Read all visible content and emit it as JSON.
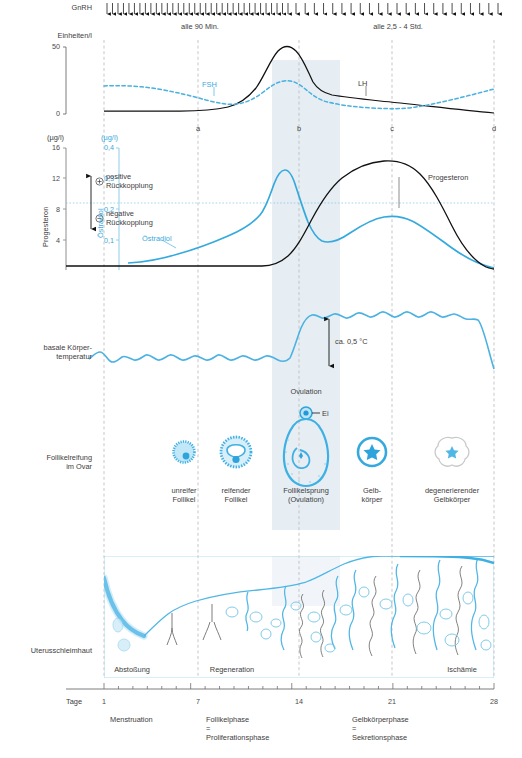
{
  "figure": {
    "accent_blue": "#3aa9dc",
    "dark": "#1a1a1a",
    "band_fill": "#dfe9ef"
  },
  "gnrh": {
    "label": "GnRH",
    "pulse_left_label": "alle 90 Min.",
    "pulse_right_label": "alle 2,5 - 4 Std.",
    "left_pulse_count": 34,
    "right_pulse_count": 23
  },
  "gonadotropin_chart": {
    "y_axis_label": "Einheiten/l",
    "y_ticks": [
      "50",
      "0"
    ],
    "series_labels": {
      "fsh": "FSH",
      "lh": "LH"
    }
  },
  "steroid_chart": {
    "y_label_left_unit": "(µg/l)",
    "y_label_right_unit": "(µg/l)",
    "y_axis_label_left": "Progesteron",
    "y_axis_label_right": "Östradiol",
    "y_ticks_left": [
      "16",
      "12",
      "8",
      "4"
    ],
    "y_ticks_right": [
      "0,4",
      "0,3",
      "0,2",
      "0,1"
    ],
    "feedback": {
      "positive_symbol": "+",
      "positive_label": "positive\nRückkopplung",
      "negative_symbol": "−",
      "negative_label": "negative\nRückkopplung"
    },
    "series_labels": {
      "estradiol": "Östradiol",
      "progesterone": "Progesteron"
    }
  },
  "temperature": {
    "label": "basale Körper-\ntemperatur",
    "delta_label": "ca. 0,5 °C",
    "ovulation_label": "Ovulation"
  },
  "ovary": {
    "label": "Follikelreifung\nim Ovar",
    "egg_label": "Ei",
    "stages": [
      {
        "name": "unreifer\nFollikel",
        "x": 184
      },
      {
        "name": "reifender\nFollikel",
        "x": 236
      },
      {
        "name": "Follikelsprung\n(Ovulation)",
        "x": 306
      },
      {
        "name": "Gelb-\nkörper",
        "x": 372
      },
      {
        "name": "degenerierender\nGelbkörper",
        "x": 452
      }
    ]
  },
  "endometrium": {
    "label": "Uterusschleimhaut",
    "annotations": [
      {
        "text": "Abstoßung",
        "x": 110
      },
      {
        "text": "Regeneration",
        "x": 206
      },
      {
        "text": "Ischämie",
        "x": 452
      }
    ]
  },
  "time_axis": {
    "label": "Tage",
    "ticks": [
      "1",
      "7",
      "14",
      "21",
      "28"
    ],
    "phases": [
      {
        "text": "Menstruation",
        "x": 110
      },
      {
        "text": "Follikelphase\n=\nProliferationsphase",
        "x": 206
      },
      {
        "text": "Gelbkörperphase\n=\nSekretionsphase",
        "x": 352
      }
    ]
  },
  "markers": {
    "letters": [
      "a",
      "b",
      "c",
      "d"
    ],
    "letter_x": [
      198,
      299,
      392,
      494
    ]
  },
  "chart_data": {
    "type": "line",
    "xlabel": "Tage",
    "x": [
      1,
      7,
      14,
      21,
      28
    ],
    "panels": [
      {
        "name": "gonadotropins",
        "ylabel": "Einheiten/l",
        "ylim": [
          0,
          55
        ],
        "yticks": [
          0,
          50
        ],
        "series": [
          {
            "name": "LH",
            "style": "solid-black",
            "x": [
              1,
              3,
              5,
              7,
              9,
              10,
              11,
              12,
              13,
              14,
              15,
              16,
              17,
              19,
              21,
              24,
              28
            ],
            "values": [
              2,
              2,
              2,
              2,
              2.5,
              4,
              9,
              25,
              42,
              46,
              38,
              28,
              24,
              21,
              18,
              12,
              1
            ]
          },
          {
            "name": "FSH",
            "style": "dashed-blue",
            "x": [
              1,
              3,
              5,
              7,
              9,
              10,
              11,
              12,
              13,
              14,
              15,
              16,
              17,
              19,
              21,
              24,
              26,
              28
            ],
            "values": [
              20,
              21,
              19,
              16,
              12,
              10,
              11,
              14,
              20,
              23,
              22,
              18,
              14,
              11,
              8,
              6,
              9,
              15
            ]
          }
        ]
      },
      {
        "name": "steroids",
        "ylabel_left": "Progesteron (µg/l)",
        "ylabel_right": "Östradiol (µg/l)",
        "ylim_left": [
          0,
          17
        ],
        "yticks_left": [
          4,
          8,
          12,
          16
        ],
        "ylim_right": [
          0,
          0.425
        ],
        "yticks_right": [
          0.1,
          0.2,
          0.3,
          0.4
        ],
        "threshold_line_right": 0.22,
        "series": [
          {
            "name": "Östradiol",
            "unit": "µg/l",
            "style": "solid-blue",
            "x": [
              1,
              3,
              5,
              7,
              9,
              10,
              11,
              12,
              13,
              13.5,
              14,
              15,
              16,
              17,
              18,
              20,
              22,
              24,
              26,
              28
            ],
            "values": [
              0.04,
              0.045,
              0.055,
              0.07,
              0.095,
              0.11,
              0.13,
              0.17,
              0.3,
              0.355,
              0.33,
              0.19,
              0.13,
              0.125,
              0.14,
              0.175,
              0.185,
              0.165,
              0.105,
              0.045
            ]
          },
          {
            "name": "Progesteron",
            "unit": "µg/l",
            "style": "solid-black",
            "x": [
              1,
              5,
              9,
              12,
              13,
              14,
              15,
              16,
              17,
              18,
              20,
              21,
              22,
              24,
              26,
              27,
              28
            ],
            "values": [
              0.4,
              0.4,
              0.4,
              0.5,
              0.9,
              2.2,
              5.0,
              8.5,
              11.5,
              13.2,
              14.7,
              14.8,
              14.3,
              11.5,
              6.5,
              3.5,
              0.8
            ]
          }
        ]
      },
      {
        "name": "basal_body_temperature",
        "ylabel": "basale Körpertemperatur",
        "annotation": "ca. 0,5 °C",
        "description": "Low plateau with small oscillations days 1–13, step rise of about 0.5 °C at ovulation, high plateau days 15–27, drop at day 28."
      }
    ],
    "phase_markers": {
      "a": 7,
      "b": 14,
      "c": 21,
      "d": 28
    },
    "shaded_band": {
      "from": 12.5,
      "to": 17.5,
      "meaning": "Ovulation window"
    },
    "legend_position": "inline labels"
  },
  "footer": {
    "note": ""
  }
}
